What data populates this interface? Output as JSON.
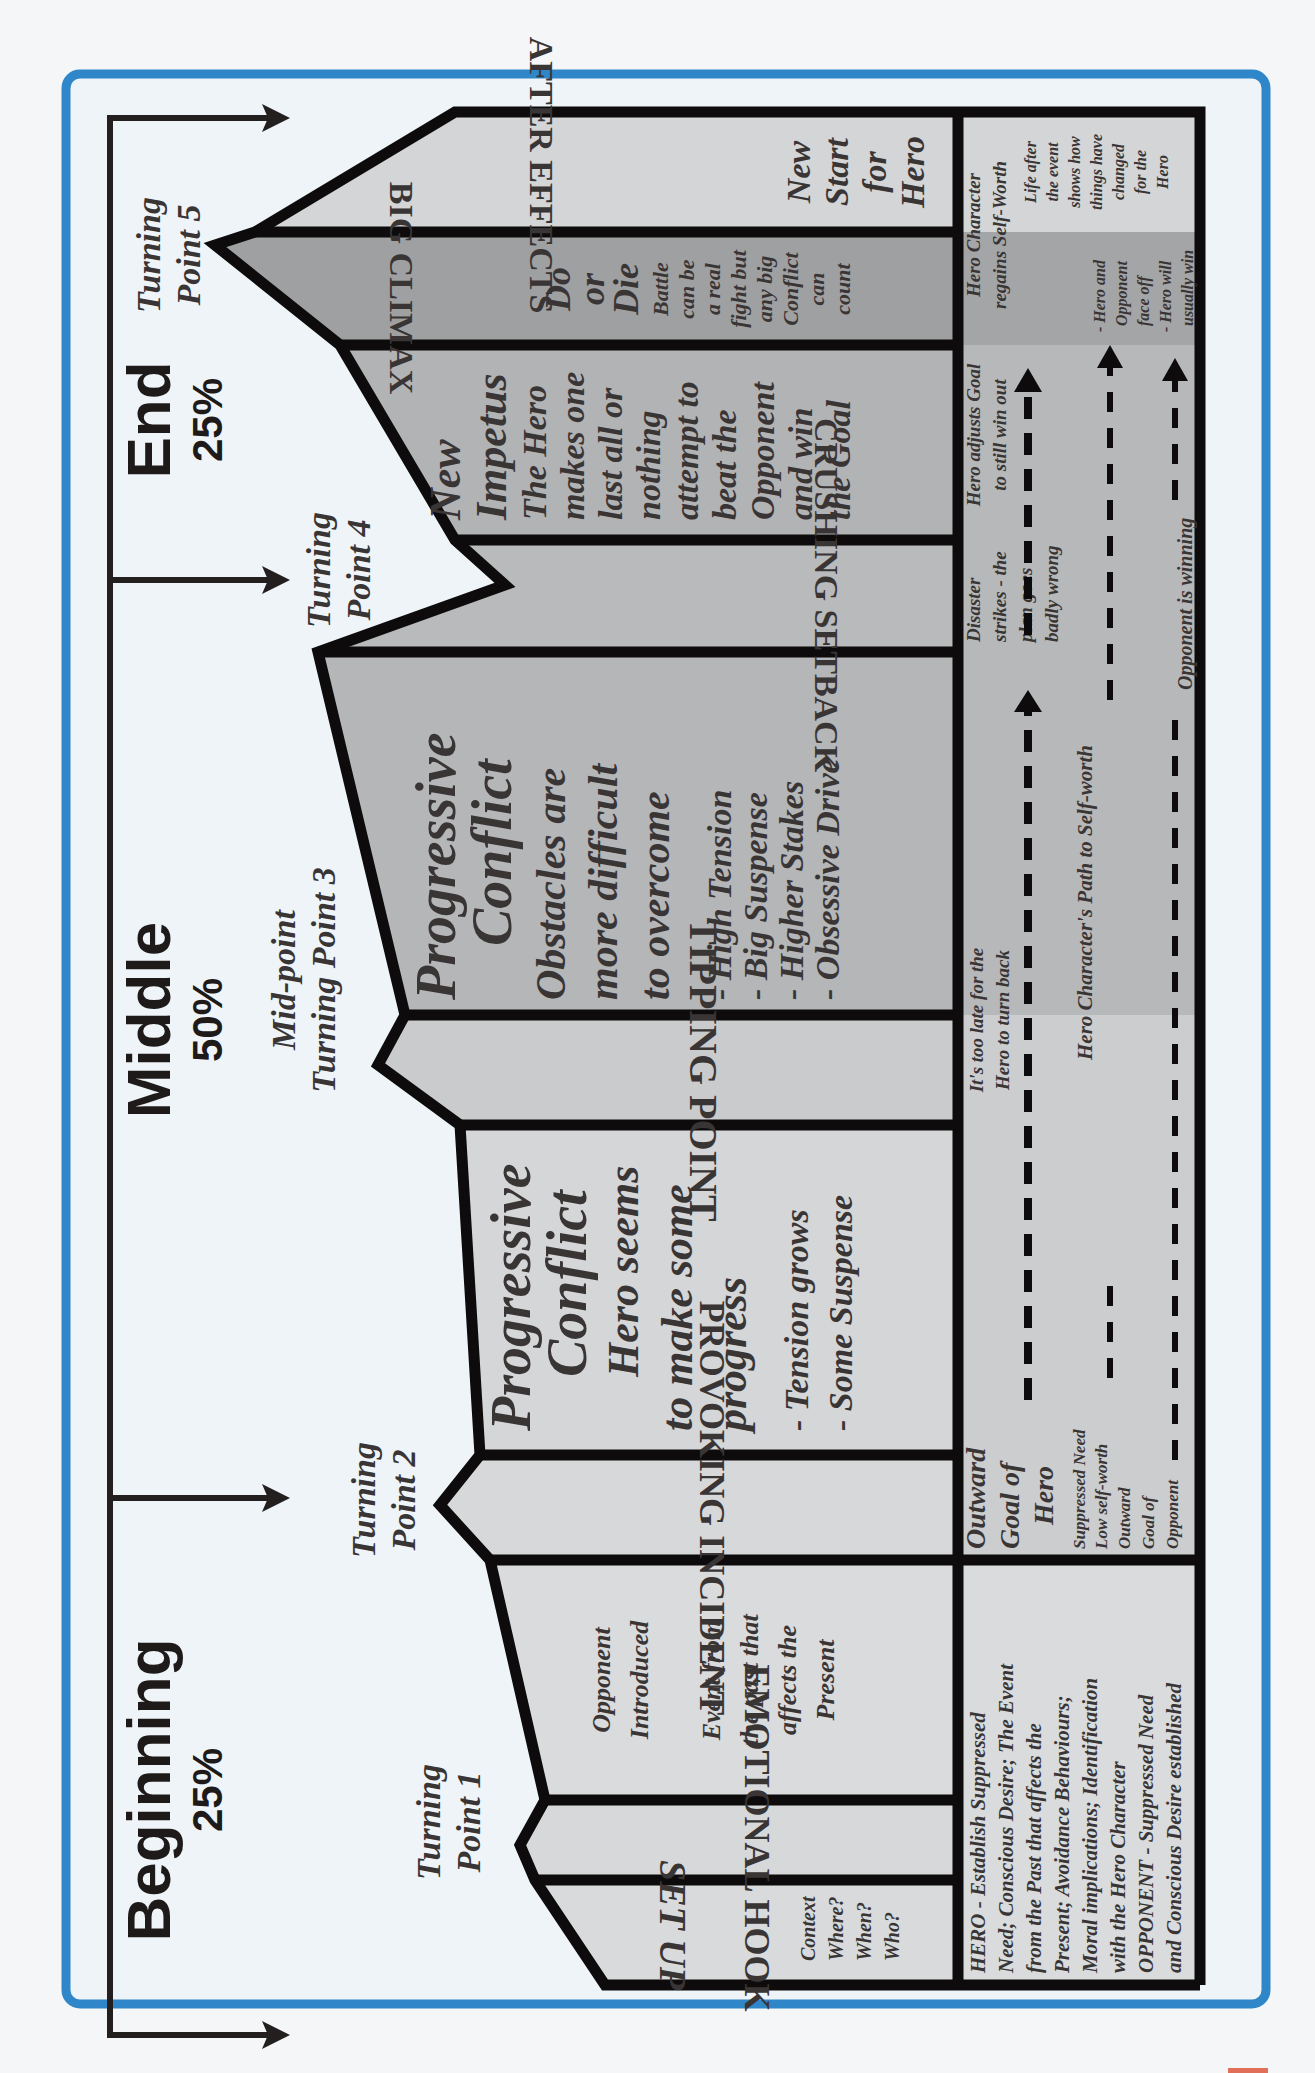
{
  "acts": [
    {
      "name": "Beginning",
      "percent": "25%"
    },
    {
      "name": "Middle",
      "percent": "50%"
    },
    {
      "name": "End",
      "percent": "25%"
    }
  ],
  "turning_points": {
    "tp1": [
      "Turning",
      "Point 1"
    ],
    "tp2": [
      "Turning",
      "Point 2"
    ],
    "tp3": [
      "Mid-point",
      "Turning Point 3"
    ],
    "tp4": [
      "Turning",
      "Point 4"
    ],
    "tp5": [
      "Turning",
      "Point 5"
    ]
  },
  "columns": {
    "set_up": {
      "title": "SET UP",
      "lines": [
        "Context",
        "Where?",
        "When?",
        "Who?"
      ]
    },
    "emotional_hook": {
      "title": "EMOTIONAL HOOK"
    },
    "opponent_intro": {
      "lines1": [
        "Opponent",
        "Introduced"
      ],
      "lines2": [
        "Event from",
        "the past that",
        "affects the",
        "Present"
      ]
    },
    "provoking_incident": {
      "title": "PROVOKING INCIDENT"
    },
    "progressive_conflict_1": {
      "heading": [
        "Progressive",
        "Conflict"
      ],
      "lines": [
        "Hero seems",
        "to make some",
        "progress"
      ],
      "bullets": [
        "- Tension grows",
        "- Some Suspense"
      ]
    },
    "tipping_point": {
      "title": "TIPPING POINT"
    },
    "progressive_conflict_2": {
      "heading": [
        "Progressive",
        "Conflict"
      ],
      "lines": [
        "Obstacles are",
        "more difficult",
        "to overcome"
      ],
      "bullets": [
        "- High Tension",
        "- Big Suspense",
        "- Higher Stakes",
        "- Obsessive Drive"
      ]
    },
    "crushing_setback": {
      "title": "CRUSHING SETBACK"
    },
    "new_impetus": {
      "heading": [
        "New",
        "Impetus"
      ],
      "lines": [
        "The Hero",
        "makes one",
        "last all or",
        "nothing",
        "attempt to",
        "beat the",
        "Opponent",
        "and win",
        "the Goal"
      ]
    },
    "big_climax": {
      "title": "BIG CLIMAX",
      "heading": [
        "Do",
        "or",
        "Die"
      ],
      "lines": [
        "Battle",
        "can be",
        "a real",
        "fight but",
        "any big",
        "Conflict",
        "can",
        "count"
      ]
    },
    "after_effects": {
      "title": "AFTER EFFECTS",
      "lines": [
        "New",
        "Start",
        "for",
        "Hero"
      ]
    }
  },
  "bottom_band": {
    "intro": [
      "HERO - Establish Suppressed",
      "Need; Conscious Desire; The Event",
      "from the Past that affects the",
      "Present; Avoidance Behaviours;",
      "Moral implications; Identification",
      "with the Hero Character",
      "OPPONENT - Suppressed Need",
      "and Conscious Desire established"
    ],
    "outward_goal_hero": [
      "Outward",
      "Goal of",
      "Hero"
    ],
    "suppressed_need": [
      "Suppressed Need",
      "Low self-worth"
    ],
    "outward_goal_opponent": [
      "Outward",
      "Goal of",
      "Opponent"
    ],
    "too_late": [
      "It's too late for the",
      "Hero to turn back"
    ],
    "path_to_self_worth": "Hero Character's Path to Self-worth",
    "disaster": [
      "Disaster",
      "strikes - the",
      "plan goes",
      "badly wrong"
    ],
    "opponent_winning": "Opponent is winning",
    "hero_adjusts": [
      "Hero adjusts Goal",
      "to still win out"
    ],
    "regains": [
      "Hero Character",
      "regains Self-Worth"
    ],
    "face_off": [
      "- Hero and",
      "Opponent",
      "face off",
      "- Hero will",
      "usually win"
    ],
    "life_after": [
      "Life after",
      "the event",
      "shows how",
      "things have",
      "changed",
      "for the",
      "Hero"
    ]
  },
  "colors": {
    "frame": "#2f86c8",
    "background": "#eef4f8",
    "outline": "#0d0b0b",
    "light_fill": "#d6d8da",
    "mid_fill": "#b4b5b7",
    "dark_fill": "#9fa0a2",
    "text": "#3a3535"
  }
}
